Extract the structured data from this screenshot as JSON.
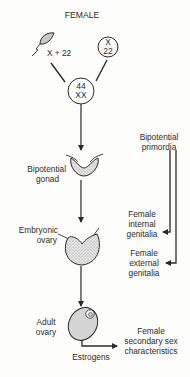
{
  "title": "FEMALE",
  "gametes": {
    "sperm_label": "X + 22",
    "egg_line1": "X",
    "egg_line2": "22"
  },
  "zygote": {
    "line1": "44",
    "line2": "XX"
  },
  "stages": [
    {
      "id": "bipotential-gonad",
      "line1": "Bipotential",
      "line2": "gonad"
    },
    {
      "id": "embryonic-ovary",
      "line1": "Embryonic",
      "line2": "ovary"
    },
    {
      "id": "adult-ovary",
      "line1": "Adult",
      "line2": "ovary"
    }
  ],
  "hormone": "Estrogens",
  "secondary": {
    "line1": "Female",
    "line2": "secondary sex",
    "line3": "characteristics"
  },
  "primordia": {
    "line1": "Bipotential",
    "line2": "primordia"
  },
  "internal_genitalia": {
    "line1": "Female",
    "line2": "internal",
    "line3": "genitalia"
  },
  "external_genitalia": {
    "line1": "Female",
    "line2": "external",
    "line3": "genitalia"
  },
  "colors": {
    "line": "#2a2a2a",
    "fill": "#d8d8d8",
    "background": "#fdfdfc"
  }
}
